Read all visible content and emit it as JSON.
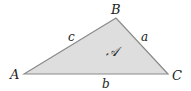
{
  "diagram": {
    "type": "triangle",
    "vertices": [
      {
        "name": "A",
        "label": "A",
        "x": 24,
        "y": 74
      },
      {
        "name": "B",
        "label": "B",
        "x": 116,
        "y": 18
      },
      {
        "name": "C",
        "label": "C",
        "x": 168,
        "y": 74
      }
    ],
    "sides": [
      {
        "name": "a",
        "label": "a",
        "between": [
          "B",
          "C"
        ]
      },
      {
        "name": "b",
        "label": "b",
        "between": [
          "A",
          "C"
        ]
      },
      {
        "name": "c",
        "label": "c",
        "between": [
          "A",
          "B"
        ]
      }
    ],
    "area_label": "𝒜",
    "colors": {
      "fill": "#dedede",
      "stroke": "#8a8a8a",
      "text": "#222222"
    }
  }
}
